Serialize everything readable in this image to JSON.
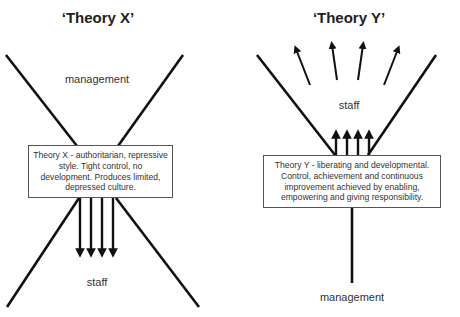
{
  "theory_x": {
    "title": "‘Theory X’",
    "top_label": "management",
    "bottom_label": "staff",
    "description": "Theory X - authoritarian, repressive style. Tight control, no development. Produces limited, depressed culture."
  },
  "theory_y": {
    "title": "‘Theory Y’",
    "top_label": "staff",
    "bottom_label": "management",
    "description": "Theory Y - liberating and developmental. Control, achievement and continuous improvement achieved by enabling, empowering and giving responsibility."
  },
  "colors": {
    "line": "#111111",
    "text": "#333333",
    "box_border": "#555555",
    "background": "#ffffff"
  }
}
